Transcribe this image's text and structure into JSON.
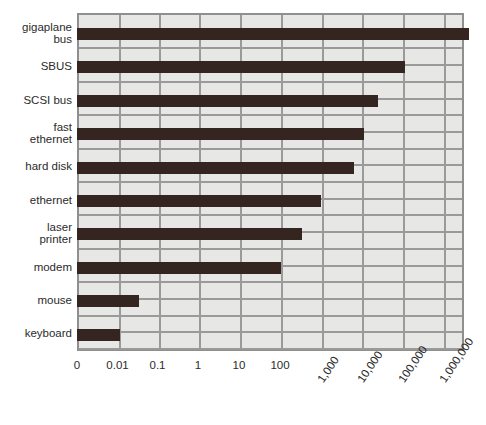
{
  "chart_data": {
    "type": "bar",
    "orientation": "horizontal",
    "title": "",
    "subtitle": "",
    "xlabel": "",
    "ylabel": "",
    "xscale": "log",
    "grid": true,
    "legend": null,
    "categories": [
      "gigaplane\nbus",
      "SBUS",
      "SCSI bus",
      "fast\nethernet",
      "hard disk",
      "ethernet",
      "laser\nprinter",
      "modem",
      "mouse",
      "keyboard"
    ],
    "values": [
      2500000,
      160000,
      35000,
      12500,
      7000,
      1250,
      350,
      100,
      0.035,
      0.01
    ],
    "value_unit": "KB/s",
    "xtick_labels": [
      "0",
      "0.01",
      "0.1",
      "1",
      "10",
      "100",
      "1,000",
      "10,000",
      "100,000",
      "1,000,000"
    ],
    "xtick_values": [
      0,
      0.01,
      0.1,
      1,
      10,
      100,
      1000,
      10000,
      100000,
      1000000
    ],
    "xlim": [
      0,
      5000000
    ],
    "bar_color": "#352520",
    "plot_background": "#e7e7e5",
    "grid_color": "#9a9a9a",
    "frame_color": "#8f8f8f"
  },
  "geometry": {
    "tick_x": [
      77,
      117.5,
      157.5,
      198,
      239,
      280,
      320.5,
      361,
      402,
      442.5
    ],
    "right_edge": 464,
    "bar_end_x": [
      467,
      403,
      376,
      362,
      352,
      319,
      300,
      279,
      137,
      118
    ],
    "row_top_y": [
      28,
      61.4,
      94.8,
      128.2,
      161.6,
      195,
      228.4,
      261.8,
      295.2,
      328.6
    ],
    "row_pitch": 33.4,
    "plot_top": 13,
    "plot_bottom": 351,
    "bar_height": 12
  },
  "rotated_ticks": [
    "1,000",
    "10,000",
    "100,000",
    "1,000,000"
  ],
  "horizontal_ticks": [
    "0",
    "0.01",
    "0.1",
    "1",
    "10",
    "100"
  ]
}
